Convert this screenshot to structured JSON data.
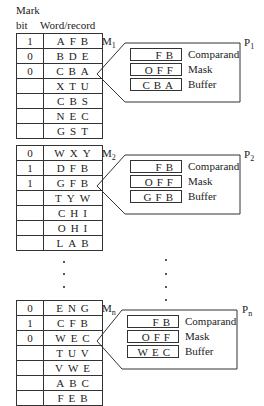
{
  "header": {
    "mark_label_1": "Mark",
    "mark_label_2": "bit",
    "word_label": "Word/record"
  },
  "memories": [
    {
      "label": "M",
      "sub": "1",
      "processor": "P",
      "psub": "1",
      "rows": [
        {
          "mark": "1",
          "word": "AFB"
        },
        {
          "mark": "0",
          "word": "BDE"
        },
        {
          "mark": "0",
          "word": "CBA"
        },
        {
          "mark": "",
          "word": "XTU"
        },
        {
          "mark": "",
          "word": "CBS"
        },
        {
          "mark": "",
          "word": "NEC"
        },
        {
          "mark": "",
          "word": "GST"
        }
      ],
      "comparand": "FB",
      "mask": "OFF",
      "buffer": "CBA"
    },
    {
      "label": "M",
      "sub": "2",
      "processor": "P",
      "psub": "2",
      "rows": [
        {
          "mark": "0",
          "word": "WXY"
        },
        {
          "mark": "1",
          "word": "DFB"
        },
        {
          "mark": "1",
          "word": "GFB"
        },
        {
          "mark": "",
          "word": "TYW"
        },
        {
          "mark": "",
          "word": "CHI"
        },
        {
          "mark": "",
          "word": "OHI"
        },
        {
          "mark": "",
          "word": "LAB"
        }
      ],
      "comparand": "FB",
      "mask": "OFF",
      "buffer": "GFB"
    },
    {
      "label": "M",
      "sub": "n",
      "processor": "P",
      "psub": "n",
      "rows": [
        {
          "mark": "0",
          "word": "ENG"
        },
        {
          "mark": "1",
          "word": "CFB"
        },
        {
          "mark": "0",
          "word": "WEC"
        },
        {
          "mark": "",
          "word": "TUV"
        },
        {
          "mark": "",
          "word": "VWE"
        },
        {
          "mark": "",
          "word": "ABC"
        },
        {
          "mark": "",
          "word": "FEB"
        }
      ],
      "comparand": "FB",
      "mask": "OFF",
      "buffer": "WEC"
    }
  ],
  "register_labels": {
    "comparand": "Comparand",
    "mask": "Mask",
    "buffer": "Buffer"
  }
}
